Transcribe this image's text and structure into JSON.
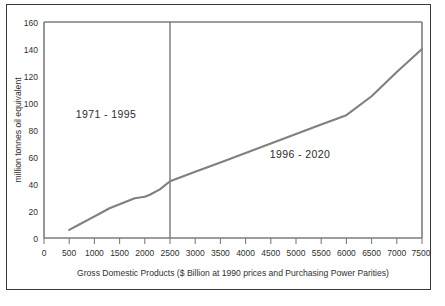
{
  "chart_data": {
    "type": "line",
    "title": "",
    "subtitle": "",
    "xlabel": "Gross Domestic Products ($ Billion at 1990 prices and Purchasing Power Parities)",
    "ylabel": "million tonnes oil equivalent",
    "xlim": [
      0,
      7500
    ],
    "ylim": [
      0,
      160
    ],
    "grid": false,
    "legend": "none",
    "x_ticks": [
      0,
      500,
      1000,
      1500,
      2000,
      2500,
      3000,
      3500,
      4000,
      4500,
      5000,
      5500,
      6000,
      6500,
      7000,
      7500
    ],
    "x_tick_labels": [
      "0",
      "500",
      "1000",
      "1500",
      "2000",
      "2500",
      "3000",
      "3500",
      "4000",
      "4500",
      "5000",
      "5500",
      "6000",
      "6500",
      "7000",
      "7500"
    ],
    "y_ticks": [
      0,
      20,
      40,
      60,
      80,
      100,
      120,
      140,
      160
    ],
    "y_tick_labels": [
      "0",
      "20",
      "40",
      "60",
      "80",
      "100",
      "120",
      "140",
      "160"
    ],
    "series": [
      {
        "name": "oil equivalent vs GDP",
        "color": "#808080",
        "x": [
          500,
          700,
          900,
          1100,
          1300,
          1500,
          1700,
          1800,
          1900,
          2000,
          2100,
          2300,
          2500,
          3000,
          3500,
          4000,
          4500,
          5000,
          5500,
          6000,
          6500,
          7000,
          7500
        ],
        "values": [
          6,
          10,
          14,
          18,
          22,
          25,
          28,
          29.5,
          30,
          30.5,
          32,
          36,
          42,
          49,
          56,
          63,
          70,
          77,
          84,
          91,
          105,
          123,
          140
        ]
      }
    ],
    "annotations": [
      {
        "text": "1971 - 1995",
        "x": 1250,
        "y": 92
      },
      {
        "text": "1996 - 2020",
        "x": 4450,
        "y": 58
      }
    ],
    "reference_lines": [
      {
        "orientation": "vertical",
        "x": 2500,
        "color": "#6e6e6e"
      }
    ]
  },
  "axis": {
    "x_title": "Gross Domestic Products ($ Billion at 1990 prices and Purchasing Power Parities)",
    "y_title": "million tonnes oil equivalent"
  },
  "annotations": {
    "left_period": "1971 - 1995",
    "right_period": "1996 - 2020"
  },
  "colors": {
    "line": "#808080",
    "axis": "#7d7d7d",
    "divider": "#6e6e6e",
    "border": "#3a3a3a",
    "text": "#2f2f2f",
    "background": "#ffffff"
  }
}
